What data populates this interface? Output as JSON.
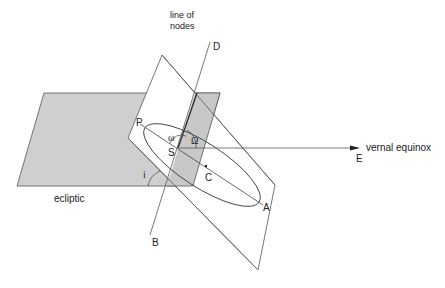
{
  "diagram": {
    "title": "",
    "labels": {
      "line_of_nodes_1": "line of",
      "line_of_nodes_2": "nodes",
      "D": "D",
      "B": "B",
      "P": "P",
      "S": "S",
      "C": "C",
      "A": "A",
      "E": "E",
      "omega_small": "ω",
      "omega_big": "Ω",
      "inclination": "i",
      "ecliptic": "ecliptic",
      "vernal_equinox": "vernal equinox"
    },
    "colors": {
      "ecliptic_fill": "#cfcfcf",
      "overlap_fill": "#c4c4c4",
      "line": "#555555",
      "orbit_plane_fill": "#ffffff"
    }
  }
}
